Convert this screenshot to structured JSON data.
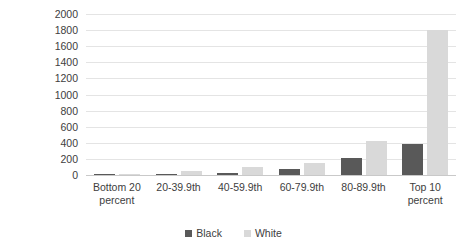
{
  "chart_data": {
    "type": "bar",
    "title": "",
    "subtitle": "",
    "xlabel": "",
    "ylabel": "Networth in thousands of dollars\n(2016)",
    "categories": [
      "Bottom 20\npercent",
      "20-39.9th",
      "40-59.9th",
      "60-79.9th",
      "80-89.9th",
      "Top 10\npercent"
    ],
    "series": [
      {
        "name": "Black",
        "color": "#595959",
        "values": [
          2,
          10,
          25,
          70,
          215,
          380
        ]
      },
      {
        "name": "White",
        "color": "#d9d9d9",
        "values": [
          5,
          55,
          105,
          155,
          425,
          1800
        ]
      }
    ],
    "ylim": [
      0,
      2000
    ],
    "ytick_step": 200,
    "yticks": [
      "0",
      "200",
      "400",
      "600",
      "800",
      "1000",
      "1200",
      "1400",
      "1600",
      "1800",
      "2000"
    ],
    "grid": true,
    "grid_axis": "y",
    "legend_position": "bottom",
    "legend": [
      "Black",
      "White"
    ],
    "background": "#ffffff"
  }
}
